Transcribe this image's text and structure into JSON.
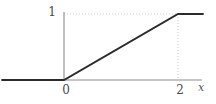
{
  "figure": {
    "kind": "line-plot",
    "background_color": "#ffffff",
    "width": 216,
    "height": 104
  },
  "axes": {
    "x_axis_label": "x",
    "y_axis_label": "",
    "x_tick_labels": [
      "0",
      "2"
    ],
    "y_tick_labels": [
      "1"
    ],
    "axis_color": "#8c8c8c",
    "grid_color": "#c8c8c8",
    "grid_style": "dotted",
    "grid_visible": true
  },
  "curve": {
    "color": "#2b2b2b",
    "width_px": 2,
    "description": "clamped ramp: 0 for x<0, x/2 for 0<=x<=2, 1 for x>2"
  },
  "chart_data": {
    "type": "line",
    "title": "",
    "subtitle": "",
    "xlabel": "x",
    "ylabel": "",
    "xlim": [
      -1.1,
      2.5
    ],
    "ylim": [
      -0.2,
      1.2
    ],
    "xticks": [
      0,
      2
    ],
    "xtick_labels": [
      "0",
      "2"
    ],
    "yticks": [
      1
    ],
    "ytick_labels": [
      "1"
    ],
    "grid": true,
    "legend": null,
    "legend_position": "none",
    "annotations": [
      {
        "text": "1",
        "x": -0.22,
        "y": 1.0,
        "role": "y-tick-label"
      },
      {
        "text": "0",
        "x": 0.0,
        "y": -0.17,
        "role": "x-tick-label"
      },
      {
        "text": "2",
        "x": 2.0,
        "y": -0.17,
        "role": "x-tick-label"
      },
      {
        "text": "x",
        "x": 2.42,
        "y": -0.12,
        "role": "axis-name"
      }
    ],
    "series": [
      {
        "name": "ramp",
        "color": "#2b2b2b",
        "x": [
          -1.1,
          0,
          2,
          2.45
        ],
        "y": [
          0,
          0,
          1,
          1
        ]
      }
    ],
    "gridlines": [
      {
        "orientation": "horizontal",
        "value": 1,
        "from": 0,
        "to": 2
      },
      {
        "orientation": "vertical",
        "value": 2,
        "from": 0,
        "to": 1
      }
    ]
  }
}
